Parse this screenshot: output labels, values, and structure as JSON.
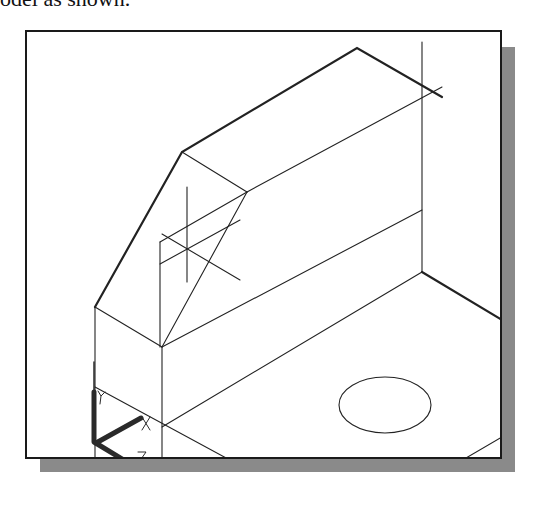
{
  "caption": "odel as shown.",
  "figure": {
    "type": "CAD isometric wireframe viewport",
    "ucs_icon": {
      "labels": [
        "Y",
        "X",
        "Z"
      ]
    },
    "colors": {
      "frame": "#1a1a1a",
      "shadow": "#8a8a8a",
      "lines": "#222222",
      "background": "#ffffff"
    }
  }
}
